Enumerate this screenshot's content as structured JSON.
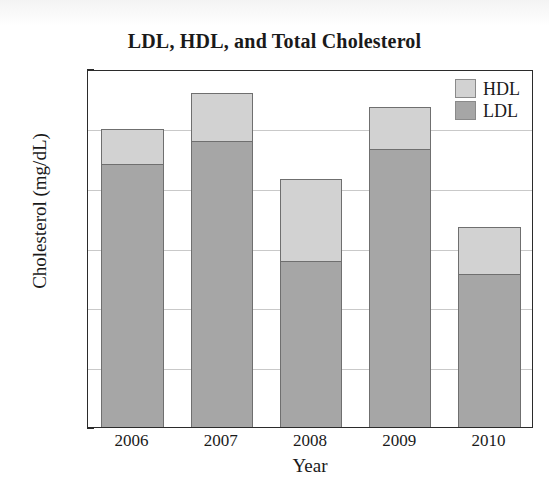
{
  "chart_data": {
    "type": "bar",
    "title": "LDL, HDL, and Total Cholesterol",
    "xlabel": "Year",
    "ylabel": "Cholesterol (mg/dL)",
    "categories": [
      "2006",
      "2007",
      "2008",
      "2009",
      "2010"
    ],
    "ylim": [
      0,
      300
    ],
    "yticks": [
      0,
      50,
      100,
      150,
      200,
      250,
      300
    ],
    "ytick_labels": [
      "0",
      "50",
      "100",
      "150",
      "200",
      "250",
      "300"
    ],
    "grid": true,
    "stacked": true,
    "legend_position": "top-right",
    "series": [
      {
        "name": "LDL",
        "color": "#a6a6a6",
        "values": [
          220,
          240,
          139,
          233,
          128
        ]
      },
      {
        "name": "HDL",
        "color": "#d2d2d2",
        "values": [
          30,
          40,
          69,
          35,
          40
        ]
      }
    ],
    "totals": [
      250,
      280,
      208,
      268,
      168
    ]
  },
  "legend": {
    "items": [
      {
        "label": "HDL",
        "color": "#d2d2d2"
      },
      {
        "label": "LDL",
        "color": "#a6a6a6"
      }
    ]
  }
}
